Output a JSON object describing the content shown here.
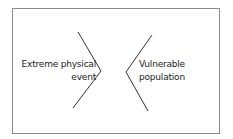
{
  "diagram": {
    "left": {
      "line1": "Extreme physical",
      "line2": "event"
    },
    "right": {
      "line1": "Vulnerable",
      "line2": "population"
    },
    "colors": {
      "stroke": "#333333",
      "border": "#8a8a8a",
      "text": "#222222"
    }
  }
}
